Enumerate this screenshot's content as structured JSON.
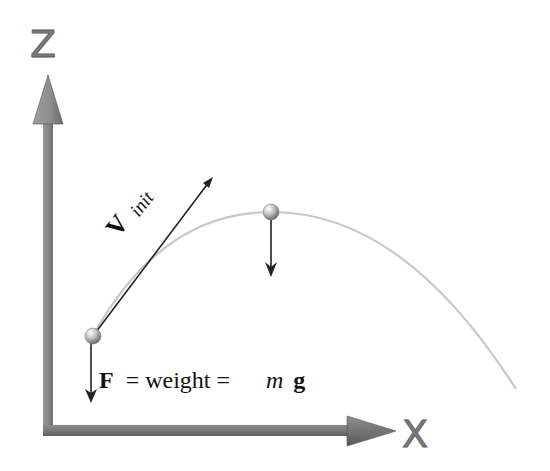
{
  "diagram": {
    "axes": {
      "z_label": "Z",
      "x_label": "X",
      "color": "#7f7f7f"
    },
    "velocity": {
      "symbol": "V",
      "subscript": "init"
    },
    "force_equation": {
      "F": "F",
      "equals_weight": " = weight = ",
      "m": "m",
      "g": "g"
    },
    "trajectory": {
      "color": "#c8c8c8",
      "start_point": [
        93,
        336
      ],
      "apex_point": [
        271,
        212
      ],
      "end_point": [
        516,
        389
      ]
    },
    "balls": [
      {
        "name": "launch-ball",
        "x": 93,
        "y": 336
      },
      {
        "name": "apex-ball",
        "x": 271,
        "y": 212
      }
    ]
  }
}
